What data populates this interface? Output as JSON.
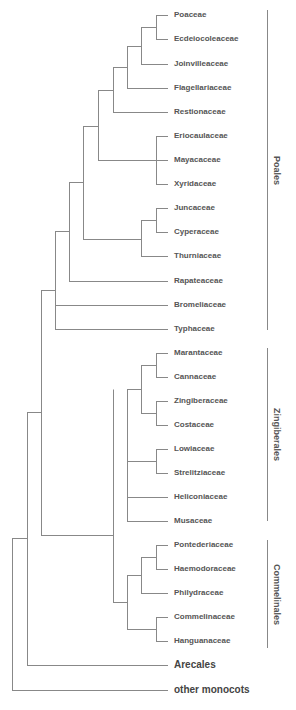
{
  "figure": {
    "type": "phylogenetic-tree-cladogram",
    "line_color": "#888888",
    "text_color": "#555555"
  },
  "leaves": [
    {
      "label": "Poaceae",
      "y": 15
    },
    {
      "label": "Ecdeiocoleaceae",
      "y": 39
    },
    {
      "label": "Joinvilleaceae",
      "y": 64
    },
    {
      "label": "Flagellariaceae",
      "y": 88
    },
    {
      "label": "Restionaceae",
      "y": 112
    },
    {
      "label": "Eriocaulaceae",
      "y": 136
    },
    {
      "label": "Mayacaceae",
      "y": 160
    },
    {
      "label": "Xyridaceae",
      "y": 184
    },
    {
      "label": "Juncaceae",
      "y": 208
    },
    {
      "label": "Cyperaceae",
      "y": 232
    },
    {
      "label": "Thurniaceae",
      "y": 256
    },
    {
      "label": "Rapateaceae",
      "y": 281
    },
    {
      "label": "Bromeliaceae",
      "y": 305
    },
    {
      "label": "Typhaceae",
      "y": 329
    },
    {
      "label": "Marantaceae",
      "y": 353
    },
    {
      "label": "Cannaceae",
      "y": 377
    },
    {
      "label": "Zingiberaceae",
      "y": 401
    },
    {
      "label": "Costaceae",
      "y": 425
    },
    {
      "label": "Lowiaceae",
      "y": 449
    },
    {
      "label": "Strelitziaceae",
      "y": 473
    },
    {
      "label": "Heliconiaceae",
      "y": 497
    },
    {
      "label": "Musaceae",
      "y": 521
    },
    {
      "label": "Pontederiaceae",
      "y": 545
    },
    {
      "label": "Haemodoraceae",
      "y": 569
    },
    {
      "label": "Philydraceae",
      "y": 593
    },
    {
      "label": "Commelinaceae",
      "y": 617
    },
    {
      "label": "Hanguanaceae",
      "y": 641
    },
    {
      "label": "Arecales",
      "y": 665,
      "big": true
    },
    {
      "label": "other monocots",
      "y": 690,
      "big": true
    }
  ],
  "clades": [
    {
      "label": "Poales",
      "y_top": 10,
      "y_bottom": 330
    },
    {
      "label": "Zingiberales",
      "y_top": 348,
      "y_bottom": 521
    },
    {
      "label": "Commelinales",
      "y_top": 540,
      "y_bottom": 648
    }
  ],
  "nodes": [
    {
      "x": 156,
      "y1": 15,
      "y2": 39
    },
    {
      "x": 141,
      "y1": 27,
      "y2": 64
    },
    {
      "x": 127,
      "y1": 46,
      "y2": 88
    },
    {
      "x": 113,
      "y1": 67,
      "y2": 112
    },
    {
      "x": 156,
      "y1": 136,
      "y2": 184
    },
    {
      "x": 98,
      "y1": 90,
      "y2": 160
    },
    {
      "x": 156,
      "y1": 208,
      "y2": 232
    },
    {
      "x": 141,
      "y1": 220,
      "y2": 256
    },
    {
      "x": 83,
      "y1": 126,
      "y2": 239
    },
    {
      "x": 69,
      "y1": 182,
      "y2": 281
    },
    {
      "x": 55,
      "y1": 231,
      "y2": 329
    },
    {
      "x": 156,
      "y1": 353,
      "y2": 377
    },
    {
      "x": 156,
      "y1": 401,
      "y2": 425
    },
    {
      "x": 141,
      "y1": 365,
      "y2": 413
    },
    {
      "x": 156,
      "y1": 449,
      "y2": 473
    },
    {
      "x": 127,
      "y1": 389,
      "y2": 521
    },
    {
      "x": 156,
      "y1": 545,
      "y2": 569
    },
    {
      "x": 141,
      "y1": 557,
      "y2": 593
    },
    {
      "x": 156,
      "y1": 617,
      "y2": 641
    },
    {
      "x": 127,
      "y1": 575,
      "y2": 629
    },
    {
      "x": 113,
      "y1": 389,
      "y2": 602
    },
    {
      "x": 41,
      "y1": 290,
      "y2": 535
    },
    {
      "x": 27,
      "y1": 412,
      "y2": 665
    },
    {
      "x": 12,
      "y1": 538,
      "y2": 690
    }
  ],
  "edges": [
    {
      "x1": 156,
      "x2": 167,
      "y": 15
    },
    {
      "x1": 156,
      "x2": 167,
      "y": 39
    },
    {
      "x1": 141,
      "x2": 156,
      "y": 27
    },
    {
      "x1": 141,
      "x2": 167,
      "y": 64
    },
    {
      "x1": 127,
      "x2": 141,
      "y": 46
    },
    {
      "x1": 127,
      "x2": 167,
      "y": 88
    },
    {
      "x1": 113,
      "x2": 127,
      "y": 67
    },
    {
      "x1": 113,
      "x2": 167,
      "y": 112
    },
    {
      "x1": 156,
      "x2": 167,
      "y": 136
    },
    {
      "x1": 156,
      "x2": 167,
      "y": 160
    },
    {
      "x1": 156,
      "x2": 167,
      "y": 184
    },
    {
      "x1": 98,
      "x2": 113,
      "y": 90
    },
    {
      "x1": 98,
      "x2": 156,
      "y": 160
    },
    {
      "x1": 156,
      "x2": 167,
      "y": 208
    },
    {
      "x1": 156,
      "x2": 167,
      "y": 232
    },
    {
      "x1": 141,
      "x2": 156,
      "y": 220
    },
    {
      "x1": 141,
      "x2": 167,
      "y": 256
    },
    {
      "x1": 83,
      "x2": 98,
      "y": 126
    },
    {
      "x1": 83,
      "x2": 141,
      "y": 239
    },
    {
      "x1": 69,
      "x2": 83,
      "y": 182
    },
    {
      "x1": 69,
      "x2": 167,
      "y": 281
    },
    {
      "x1": 55,
      "x2": 69,
      "y": 231
    },
    {
      "x1": 55,
      "x2": 167,
      "y": 305
    },
    {
      "x1": 55,
      "x2": 167,
      "y": 329
    },
    {
      "x1": 156,
      "x2": 167,
      "y": 353
    },
    {
      "x1": 156,
      "x2": 167,
      "y": 377
    },
    {
      "x1": 156,
      "x2": 167,
      "y": 401
    },
    {
      "x1": 156,
      "x2": 167,
      "y": 425
    },
    {
      "x1": 141,
      "x2": 156,
      "y": 365
    },
    {
      "x1": 141,
      "x2": 156,
      "y": 413
    },
    {
      "x1": 156,
      "x2": 167,
      "y": 449
    },
    {
      "x1": 156,
      "x2": 167,
      "y": 473
    },
    {
      "x1": 127,
      "x2": 141,
      "y": 389
    },
    {
      "x1": 127,
      "x2": 156,
      "y": 461
    },
    {
      "x1": 127,
      "x2": 167,
      "y": 497
    },
    {
      "x1": 127,
      "x2": 167,
      "y": 521
    },
    {
      "x1": 156,
      "x2": 167,
      "y": 545
    },
    {
      "x1": 156,
      "x2": 167,
      "y": 569
    },
    {
      "x1": 141,
      "x2": 156,
      "y": 557
    },
    {
      "x1": 141,
      "x2": 167,
      "y": 593
    },
    {
      "x1": 156,
      "x2": 167,
      "y": 617
    },
    {
      "x1": 156,
      "x2": 167,
      "y": 641
    },
    {
      "x1": 127,
      "x2": 141,
      "y": 575
    },
    {
      "x1": 127,
      "x2": 156,
      "y": 629
    },
    {
      "x1": 113,
      "x2": 127,
      "y": 602
    },
    {
      "x1": 41,
      "x2": 55,
      "y": 290
    },
    {
      "x1": 41,
      "x2": 113,
      "y": 535
    },
    {
      "x1": 27,
      "x2": 41,
      "y": 412
    },
    {
      "x1": 27,
      "x2": 167,
      "y": 665
    },
    {
      "x1": 12,
      "x2": 27,
      "y": 538
    },
    {
      "x1": 12,
      "x2": 167,
      "y": 690
    }
  ]
}
